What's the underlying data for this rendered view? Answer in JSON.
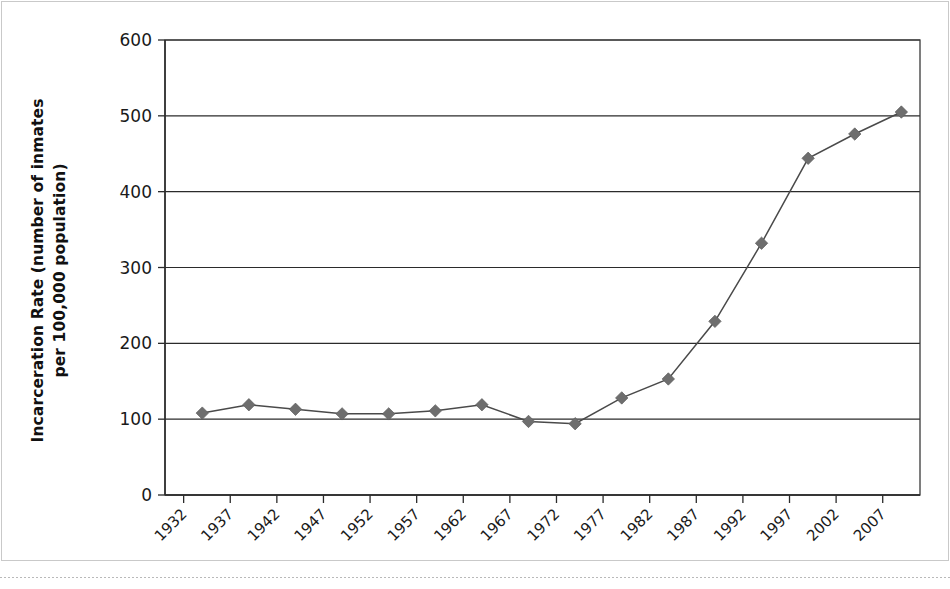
{
  "chart_data": {
    "type": "line",
    "title": "",
    "xlabel": "",
    "ylabel": "Incarceration Rate (number of inmates\nper 100,000 population)",
    "ylabel_line1": "Incarceration Rate (number of inmates",
    "ylabel_line2": "per 100,000 population)",
    "ylim": [
      0,
      600
    ],
    "ytick_values": [
      0,
      100,
      200,
      300,
      400,
      500,
      600
    ],
    "ytick_labels": [
      "0",
      "100",
      "200",
      "300",
      "400",
      "500",
      "600"
    ],
    "xlim": [
      1930,
      2011
    ],
    "xtick_labels": [
      "1932",
      "1937",
      "1942",
      "1947",
      "1952",
      "1957",
      "1962",
      "1967",
      "1972",
      "1977",
      "1982",
      "1987",
      "1992",
      "1997",
      "2002",
      "2007"
    ],
    "xtick_values": [
      1932,
      1937,
      1942,
      1947,
      1952,
      1957,
      1962,
      1967,
      1972,
      1977,
      1982,
      1987,
      1992,
      1997,
      2002,
      2007
    ],
    "xtick_rotation": 45,
    "grid": "horizontal",
    "legend": "none",
    "marker": "diamond",
    "series": [
      {
        "name": "Incarceration Rate",
        "color": "#6e6e6e",
        "line_color": "#4a4a4a",
        "x": [
          1934,
          1939,
          1944,
          1949,
          1954,
          1959,
          1964,
          1969,
          1974,
          1979,
          1984,
          1989,
          1994,
          1999,
          2004,
          2009
        ],
        "values": [
          108,
          119,
          113,
          107,
          107,
          111,
          119,
          97,
          94,
          128,
          153,
          229,
          332,
          444,
          476,
          505
        ]
      }
    ],
    "annotations": []
  },
  "colors": {
    "axis": "#2b2b2b",
    "grid": "#2b2b2b",
    "marker": "#6e6e6e",
    "line": "#4a4a4a",
    "text": "#1a1a1a",
    "background": "#ffffff",
    "frame": "#c9c9c9",
    "bottom_rule": "#b9b9b9"
  },
  "geometry": {
    "plot_left": 165,
    "plot_right": 920,
    "plot_top": 40,
    "plot_bottom": 495
  }
}
